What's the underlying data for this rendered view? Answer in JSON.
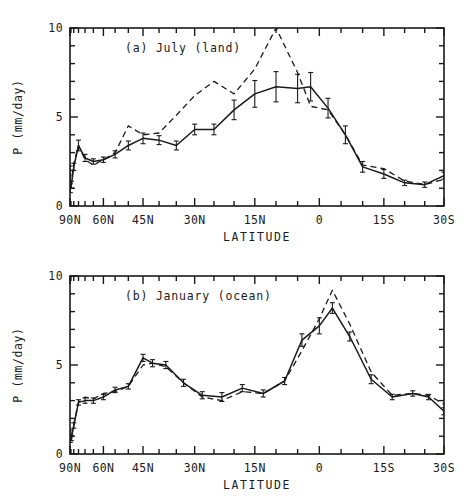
{
  "figure": {
    "background": "#ffffff",
    "ink": "#1a1a1a",
    "width": 474,
    "height": 501
  },
  "axis_geometry": {
    "note": "x axis is linear in sine(latitude), equal-area spacing",
    "panel_a": {
      "left": 70,
      "right": 444,
      "top": 28,
      "bottom": 206
    },
    "panel_b": {
      "left": 70,
      "right": 444,
      "top": 25,
      "bottom": 203
    }
  },
  "chart_data": [
    {
      "type": "line",
      "id": "panel-a",
      "title": "(a)    July (land)",
      "panel_letter": "(a)",
      "panel_name": "July (land)",
      "xlabel": "LATITUDE",
      "ylabel": "P (mm/day)",
      "ylim": [
        0,
        10
      ],
      "yticks": [
        0,
        5,
        10
      ],
      "ytick_labels": [
        "0",
        "5",
        "10"
      ],
      "yminor_step": 1,
      "xlim_lat": [
        90,
        -30
      ],
      "xticks_lat": [
        90,
        60,
        45,
        30,
        15,
        0,
        -15,
        -30
      ],
      "xtick_labels": [
        "90N",
        "60N",
        "45N",
        "30N",
        "15N",
        "0",
        "15S",
        "30S"
      ],
      "grid": false,
      "legend": "none",
      "series": [
        {
          "name": "solid",
          "style": "solid",
          "x_lat": [
            89,
            87,
            84,
            80,
            75,
            70,
            65,
            60,
            55,
            50,
            45,
            40,
            35,
            30,
            25,
            20,
            15,
            10,
            5,
            2,
            -2,
            -6,
            -10,
            -15,
            -20,
            -25,
            -30
          ],
          "values": [
            1.8,
            1.0,
            1.2,
            2.2,
            3.4,
            2.7,
            2.5,
            2.6,
            2.9,
            3.4,
            3.8,
            3.7,
            3.4,
            4.3,
            4.3,
            5.4,
            6.3,
            6.7,
            6.6,
            6.7,
            5.5,
            4.0,
            2.2,
            1.8,
            1.3,
            1.2,
            1.7,
            1.8
          ],
          "error": [
            0.45,
            0.25,
            0.2,
            0.2,
            0.3,
            0.2,
            0.15,
            0.15,
            0.2,
            0.25,
            0.3,
            0.25,
            0.25,
            0.3,
            0.3,
            0.55,
            0.75,
            0.85,
            0.8,
            0.8,
            0.55,
            0.5,
            0.3,
            0.25,
            0.15,
            0.15,
            0.2,
            0.2
          ]
        },
        {
          "name": "dashed",
          "style": "dashed",
          "x_lat": [
            89,
            87,
            84,
            80,
            75,
            70,
            65,
            60,
            55,
            50,
            45,
            40,
            35,
            30,
            25,
            20,
            15,
            10,
            5,
            2,
            -2,
            -6,
            -10,
            -15,
            -20,
            -25,
            -30
          ],
          "values": [
            1.3,
            1.2,
            1.4,
            2.4,
            3.4,
            2.6,
            2.3,
            2.6,
            3.0,
            4.5,
            4.0,
            4.1,
            5.1,
            6.2,
            7.0,
            6.3,
            7.7,
            10.0,
            7.5,
            5.6,
            5.4,
            4.0,
            2.3,
            2.1,
            1.4,
            1.2,
            1.5,
            1.4
          ]
        }
      ]
    },
    {
      "type": "line",
      "id": "panel-b",
      "title": "(b)    January (ocean)",
      "panel_letter": "(b)",
      "panel_name": "January (ocean)",
      "xlabel": "LATITUDE",
      "ylabel": "P (mm/day)",
      "ylim": [
        0,
        10
      ],
      "yticks": [
        0,
        5,
        10
      ],
      "ytick_labels": [
        "0",
        "5",
        "10"
      ],
      "yminor_step": 1,
      "xlim_lat": [
        90,
        -30
      ],
      "xticks_lat": [
        90,
        60,
        45,
        30,
        15,
        0,
        -15,
        -30
      ],
      "xtick_labels": [
        "90N",
        "60N",
        "45N",
        "30N",
        "15N",
        "0",
        "15S",
        "30S"
      ],
      "grid": false,
      "legend": "none",
      "series": [
        {
          "name": "solid",
          "style": "solid",
          "x_lat": [
            89,
            87,
            84,
            80,
            75,
            70,
            65,
            60,
            55,
            50,
            45,
            42,
            38,
            33,
            28,
            23,
            18,
            13,
            8,
            4,
            0,
            -3,
            -7,
            -12,
            -17,
            -22,
            -26,
            -30
          ],
          "values": [
            1.1,
            0.8,
            0.9,
            1.6,
            2.9,
            3.0,
            3.0,
            3.2,
            3.6,
            3.8,
            5.4,
            5.1,
            5.0,
            4.0,
            3.3,
            3.2,
            3.7,
            3.4,
            4.1,
            6.4,
            7.2,
            8.2,
            6.6,
            4.2,
            3.2,
            3.4,
            3.2,
            2.4
          ],
          "error": [
            0.25,
            0.15,
            0.15,
            0.15,
            0.15,
            0.15,
            0.15,
            0.15,
            0.15,
            0.15,
            0.2,
            0.2,
            0.2,
            0.2,
            0.2,
            0.25,
            0.2,
            0.2,
            0.2,
            0.35,
            0.45,
            0.3,
            0.25,
            0.25,
            0.15,
            0.15,
            0.15,
            0.2
          ]
        },
        {
          "name": "dashed",
          "style": "dashed",
          "x_lat": [
            89,
            87,
            84,
            80,
            75,
            70,
            65,
            60,
            55,
            50,
            45,
            42,
            38,
            33,
            28,
            23,
            18,
            13,
            8,
            4,
            0,
            -3,
            -7,
            -12,
            -17,
            -22,
            -26,
            -30
          ],
          "values": [
            1.0,
            0.75,
            1.0,
            1.7,
            2.9,
            3.2,
            3.1,
            3.4,
            3.5,
            3.8,
            5.0,
            5.1,
            4.9,
            4.0,
            3.2,
            3.0,
            3.5,
            3.4,
            4.1,
            5.8,
            7.6,
            9.2,
            7.3,
            4.6,
            3.3,
            3.4,
            3.3,
            2.8
          ]
        }
      ]
    }
  ]
}
